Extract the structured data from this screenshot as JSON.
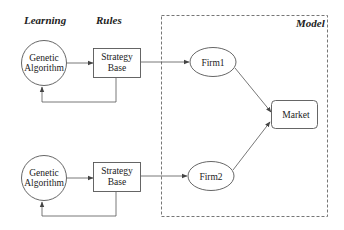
{
  "diagram": {
    "section_labels": {
      "learning": "Learning",
      "rules": "Rules",
      "model": "Model"
    },
    "nodes": {
      "ga1": {
        "line1": "Genetic",
        "line2": "Algorithm",
        "shape": "circle"
      },
      "sb1": {
        "line1": "Strategy",
        "line2": "Base",
        "shape": "rect"
      },
      "firm1": {
        "label": "Firm1",
        "shape": "ellipse"
      },
      "ga2": {
        "line1": "Genetic",
        "line2": "Algorithm",
        "shape": "circle"
      },
      "sb2": {
        "line1": "Strategy",
        "line2": "Base",
        "shape": "rect"
      },
      "firm2": {
        "label": "Firm2",
        "shape": "ellipse"
      },
      "market": {
        "label": "Market",
        "shape": "rounded-rect"
      }
    },
    "edges": [
      {
        "from": "ga1",
        "to": "sb1"
      },
      {
        "from": "sb1",
        "to": "ga1",
        "type": "feedback"
      },
      {
        "from": "sb1",
        "to": "firm1"
      },
      {
        "from": "firm1",
        "to": "market"
      },
      {
        "from": "ga2",
        "to": "sb2"
      },
      {
        "from": "sb2",
        "to": "ga2",
        "type": "feedback"
      },
      {
        "from": "sb2",
        "to": "firm2"
      },
      {
        "from": "firm2",
        "to": "market"
      }
    ],
    "colors": {
      "stroke": "#555555",
      "text": "#222222",
      "background": "#ffffff"
    }
  }
}
